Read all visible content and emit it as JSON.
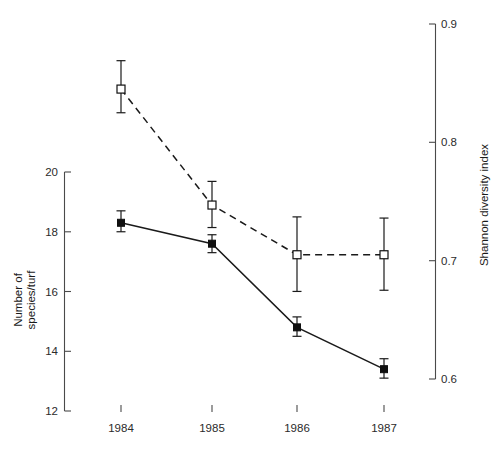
{
  "chart_data": {
    "type": "line",
    "title": "",
    "subtitle": "",
    "xlabel": "",
    "ylabel": "Number of\nspecies/turf",
    "ylabel_line1": "Number of",
    "ylabel_line2": "species/turf",
    "y2label": "Shannon diversity index",
    "categories": [
      "1984",
      "1985",
      "1986",
      "1987"
    ],
    "x": [
      1984,
      1985,
      1986,
      1987
    ],
    "ylim": [
      12,
      20
    ],
    "y2lim": [
      0.6,
      0.9
    ],
    "yticks": [
      12,
      14,
      16,
      18,
      20
    ],
    "ytick_labels": [
      "12",
      "14",
      "16",
      "18",
      "20"
    ],
    "y2ticks": [
      0.6,
      0.7,
      0.8,
      0.9
    ],
    "y2tick_labels": [
      "0.6",
      "0.7",
      "0.8",
      "0.9"
    ],
    "grid": false,
    "legend": "none",
    "series": [
      {
        "name": "Number of species/turf",
        "axis": "left",
        "marker": "filled-square",
        "line_style": "solid",
        "color": "#101010",
        "values": [
          18.3,
          17.6,
          14.8,
          13.4
        ],
        "err_low": [
          18.0,
          17.3,
          14.5,
          13.1
        ],
        "err_high": [
          18.7,
          17.9,
          15.15,
          13.75
        ]
      },
      {
        "name": "Shannon diversity index",
        "axis": "right",
        "marker": "open-square",
        "line_style": "dashed",
        "color": "#101010",
        "values": [
          0.845,
          0.747,
          0.705,
          0.705
        ],
        "err_low": [
          0.825,
          0.728,
          0.674,
          0.675
        ],
        "err_high": [
          0.869,
          0.767,
          0.737,
          0.736
        ]
      }
    ]
  },
  "caption": {
    "text": ""
  }
}
